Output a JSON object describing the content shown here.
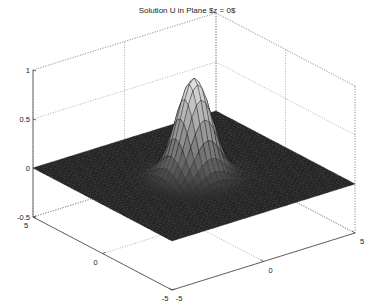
{
  "chart_data": {
    "type": "surface",
    "title": "Solution U in Plane $z = 0$",
    "xlabel": "",
    "ylabel": "",
    "zlabel": "",
    "xlim": [
      -5,
      5
    ],
    "ylim": [
      -5,
      5
    ],
    "zlim": [
      -0.5,
      1
    ],
    "x_ticks": [
      -5,
      0,
      5
    ],
    "y_ticks": [
      -5,
      0,
      5
    ],
    "z_ticks": [
      -0.5,
      0,
      0.5,
      1
    ],
    "x_tick_labels": [
      "-5",
      "0",
      "5"
    ],
    "y_tick_labels": [
      "-5",
      "0",
      "5"
    ],
    "z_tick_labels": [
      "-0.5",
      "0",
      "0.5",
      "1"
    ],
    "grid": true,
    "colormap": "gray",
    "surface": {
      "description": "Single localized bump centered at origin on a flat zero plane",
      "function": "exp(-(x^2+y^2)/1.2)",
      "peak_value": 1.0,
      "peak_location": [
        0,
        0
      ],
      "grid_range": [
        -5,
        5
      ],
      "grid_points": 41
    }
  }
}
